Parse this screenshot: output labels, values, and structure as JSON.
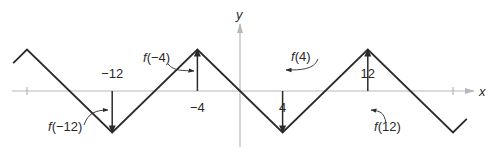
{
  "diagram": {
    "type": "function-graph",
    "axes": {
      "x_label": "x",
      "y_label": "y"
    },
    "function": {
      "period": 16,
      "peaks_at_x": [
        -20,
        -4,
        4,
        20
      ],
      "troughs_at_x": [
        -12,
        0,
        12
      ],
      "peak_value": 4,
      "trough_value": -4,
      "value_at_origin": 0,
      "x_domain": [
        -21.3,
        21.3
      ]
    },
    "tick_labels": [
      {
        "x": -12,
        "text": "−12",
        "position": "above"
      },
      {
        "x": -4,
        "text": "−4",
        "position": "below"
      },
      {
        "x": 4,
        "text": "4",
        "position": "below"
      },
      {
        "x": 12,
        "text": "12",
        "position": "above"
      }
    ],
    "unlabeled_ticks_at_x": [
      -20,
      20
    ],
    "annotations": [
      {
        "x": -12,
        "text_prefix": "f",
        "text_rest": "(−12)",
        "direction": "down"
      },
      {
        "x": -4,
        "text_prefix": "f",
        "text_rest": "(−4)",
        "direction": "up"
      },
      {
        "x": 4,
        "text_prefix": "f",
        "text_rest": "(4)",
        "direction": "up"
      },
      {
        "x": 12,
        "text_prefix": "f",
        "text_rest": "(12)",
        "direction": "down"
      }
    ]
  }
}
